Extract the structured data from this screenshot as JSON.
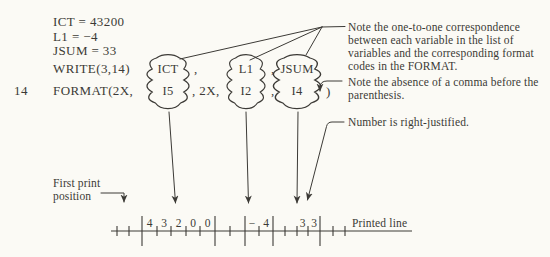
{
  "figure": {
    "code": {
      "assign1": "ICT = 43200",
      "assign2": "L1 = −4",
      "assign3": "JSUM = 33",
      "write_keyword": "WRITE(3,14)",
      "statement_label": "14",
      "format_keyword": "FORMAT(2X,",
      "write_comma1": ",",
      "write_comma2": ",",
      "format_sep": ", 2X,",
      "format_comma": ",",
      "closing_paren": ")"
    },
    "pairs": [
      {
        "variable": "ICT",
        "format_code": "I5"
      },
      {
        "variable": "L1",
        "format_code": "I2"
      },
      {
        "variable": "JSUM",
        "format_code": "I4"
      }
    ],
    "annotations": {
      "correspondence": [
        "Note the one-to-one correspondence",
        "between each variable in the list of",
        "variables and the corresponding format",
        "codes in the FORMAT."
      ],
      "comma": [
        "Note the absence of a comma before the",
        "parenthesis."
      ],
      "justified": "Number is right-justified."
    },
    "first_print_label": [
      "First print",
      "position"
    ],
    "printed_line_label": "Printed line",
    "ruler": {
      "digits_i5": [
        "4",
        "3",
        "2",
        "0",
        "0"
      ],
      "digits_i2": [
        "−",
        "4"
      ],
      "digits_i4": [
        "3",
        "3"
      ]
    },
    "colors": {
      "ink": "#3c3a36",
      "paper": "#fbfaf5"
    }
  }
}
